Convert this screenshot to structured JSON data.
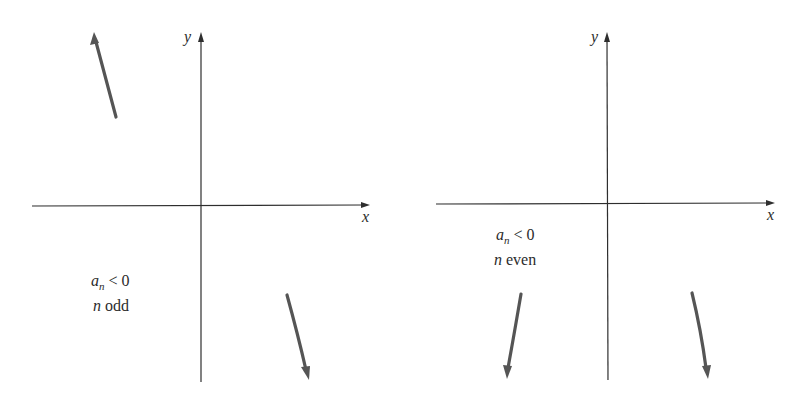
{
  "colors": {
    "background": "#ffffff",
    "axis": "#2e2e2e",
    "curve": "#555555",
    "text": "#2b2b2b"
  },
  "panels": [
    {
      "id": "odd",
      "axis_x_label": "x",
      "axis_y_label": "y",
      "condition_line1_var": "a",
      "condition_line1_sub": "n",
      "condition_line1_rel": " < 0",
      "condition_line2_var": "n",
      "condition_line2_rest": " odd",
      "end_behavior": {
        "left": "rises (up as x → −∞)",
        "right": "falls (down as x → +∞)"
      }
    },
    {
      "id": "even",
      "axis_x_label": "x",
      "axis_y_label": "y",
      "condition_line1_var": "a",
      "condition_line1_sub": "n",
      "condition_line1_rel": " < 0",
      "condition_line2_var": "n",
      "condition_line2_rest": " even",
      "end_behavior": {
        "left": "falls (down as x → −∞)",
        "right": "falls (down as x → +∞)"
      }
    }
  ]
}
